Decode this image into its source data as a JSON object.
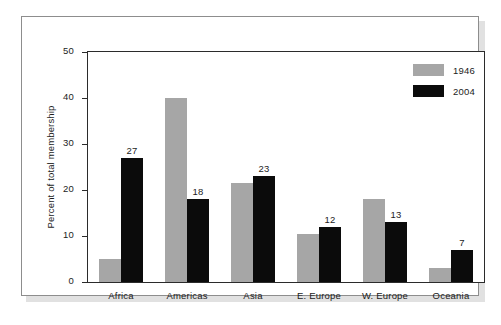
{
  "chart_data": {
    "type": "bar",
    "title": "",
    "subtitle": "",
    "xlabel": "",
    "ylabel": "Percent of total membership",
    "categories": [
      "Africa",
      "Americas",
      "Asia",
      "E. Europe",
      "W. Europe",
      "Oceania"
    ],
    "series": [
      {
        "name": "1946",
        "color": "#a6a6a6",
        "values": [
          5,
          40,
          21.5,
          10.5,
          18,
          3
        ],
        "labels": [
          "",
          "",
          "",
          "",
          "",
          ""
        ]
      },
      {
        "name": "2004",
        "color": "#0b0b0b",
        "values": [
          27,
          18,
          23,
          12,
          13,
          7
        ],
        "labels": [
          "27",
          "18",
          "23",
          "12",
          "13",
          "7"
        ]
      }
    ],
    "ylim": [
      0,
      50
    ],
    "yticks": [
      0,
      10,
      20,
      30,
      40,
      50
    ],
    "ytick_labels": [
      "0",
      "10",
      "20",
      "30",
      "40",
      "50"
    ],
    "grid": false,
    "legend_position": "top-right",
    "legend": [
      {
        "label": "1946",
        "color": "#a6a6a6"
      },
      {
        "label": "2004",
        "color": "#0b0b0b"
      }
    ]
  }
}
